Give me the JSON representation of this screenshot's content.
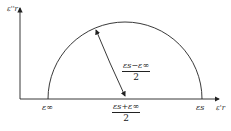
{
  "diagram": {
    "y_axis_label": "ε''r",
    "x_axis_label": "ε'r",
    "x_ticks": {
      "eps_inf": "ε∞",
      "eps_s": "εs"
    },
    "center_label": {
      "numerator": "εs+ε∞",
      "denominator": "2"
    },
    "radius_label": {
      "numerator": "εs−ε∞",
      "denominator": "2"
    },
    "colors": {
      "line": "#222222",
      "background": "#ffffff"
    }
  }
}
